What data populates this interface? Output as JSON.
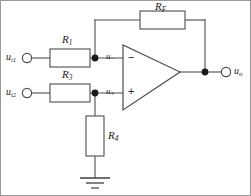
{
  "figure": {
    "kind": "circuit-schematic",
    "width": 251,
    "height": 196,
    "background_color": "#ffffff",
    "wire_color": "#4d4d4d",
    "text_color": "#1a1a1a",
    "border_color": "#9a9a9a"
  },
  "labels": {
    "input1": {
      "base": "u",
      "sub": "i1"
    },
    "input2": {
      "base": "u",
      "sub": "i2"
    },
    "inverting_node": {
      "base": "u",
      "sign": "−"
    },
    "noninverting_node": {
      "base": "u",
      "sign": "+"
    },
    "output": {
      "base": "u",
      "sub": "o"
    },
    "r1": {
      "base": "R",
      "sub": "1"
    },
    "r3": {
      "base": "R",
      "sub": "3"
    },
    "r4": {
      "base": "R",
      "sub": "4"
    },
    "rf": {
      "base": "R",
      "sub": "F"
    },
    "opamp_minus": "−",
    "opamp_plus": "+"
  },
  "components": [
    {
      "id": "R1",
      "type": "resistor",
      "orientation": "horizontal",
      "label": "R1",
      "between": [
        "u_i1 terminal",
        "inverting node"
      ]
    },
    {
      "id": "R3",
      "type": "resistor",
      "orientation": "horizontal",
      "label": "R3",
      "between": [
        "u_i2 terminal",
        "non-inverting node"
      ]
    },
    {
      "id": "R4",
      "type": "resistor",
      "orientation": "vertical",
      "label": "R4",
      "between": [
        "non-inverting node",
        "ground"
      ]
    },
    {
      "id": "RF",
      "type": "resistor",
      "orientation": "horizontal",
      "label": "RF",
      "between": [
        "inverting node",
        "output node"
      ]
    },
    {
      "id": "U1",
      "type": "opamp",
      "inputs": [
        "inverting",
        "non-inverting"
      ],
      "output": "u_o"
    },
    {
      "id": "GND",
      "type": "ground",
      "symbol": "earth-3-bar"
    }
  ],
  "terminals": [
    {
      "id": "u_i1",
      "type": "open-circle-terminal",
      "label": "u_i1"
    },
    {
      "id": "u_i2",
      "type": "open-circle-terminal",
      "label": "u_i2"
    },
    {
      "id": "u_o",
      "type": "open-circle-terminal",
      "label": "u_o"
    }
  ],
  "junctions": [
    {
      "id": "n-inverting",
      "type": "solid-dot"
    },
    {
      "id": "n-noninverting",
      "type": "solid-dot"
    },
    {
      "id": "n-output",
      "type": "solid-dot"
    }
  ]
}
